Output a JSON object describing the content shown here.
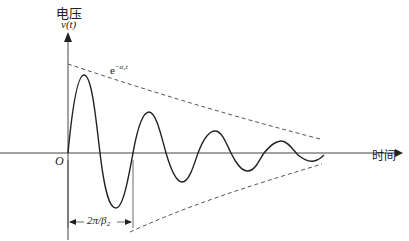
{
  "y_axis": {
    "label_cn": "电压",
    "label_var": "v(t)"
  },
  "x_axis": {
    "label": "时间"
  },
  "origin": "O",
  "envelope_label": "e^{-α₂t}",
  "envelope_text": "e",
  "envelope_sup": "−α₂t",
  "period_label": "2π/β₂",
  "colors": {
    "curve": "#222222",
    "envelope": "#555555"
  }
}
